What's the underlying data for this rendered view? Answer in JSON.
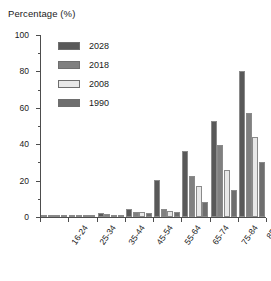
{
  "chart_data": {
    "type": "bar",
    "title": "Percentage (%)",
    "subtitle": "",
    "xlabel": "",
    "ylabel": "Percentage (%)",
    "ylim": [
      0,
      100
    ],
    "yticks": [
      0,
      20,
      40,
      60,
      80,
      100
    ],
    "yticks_minor": [
      10,
      30,
      50,
      70,
      90
    ],
    "grid": false,
    "legend_position": "top-left",
    "categories": [
      "16-24",
      "25-34",
      "35-44",
      "45-54",
      "55-64",
      "65-74",
      "75-84",
      "85+"
    ],
    "series": [
      {
        "name": "2028",
        "color": "#595959",
        "values": [
          0.3,
          0.8,
          2.0,
          4.5,
          20.5,
          36.0,
          53.0,
          80.5
        ]
      },
      {
        "name": "2018",
        "color": "#808080",
        "values": [
          0.2,
          0.6,
          1.5,
          3.0,
          4.5,
          22.5,
          39.5,
          57.0
        ]
      },
      {
        "name": "2008",
        "color": "#e8e8e8",
        "values": [
          0.2,
          0.5,
          1.2,
          2.5,
          3.5,
          17.0,
          26.0,
          44.0
        ]
      },
      {
        "name": "1990",
        "color": "#6e6e6e",
        "values": [
          0.1,
          0.4,
          1.0,
          2.0,
          2.5,
          8.0,
          15.0,
          30.0
        ]
      }
    ]
  },
  "legend": {
    "items": [
      {
        "label": "2028"
      },
      {
        "label": "2018"
      },
      {
        "label": "2008"
      },
      {
        "label": "1990"
      }
    ]
  },
  "colors": {
    "axis": "#4d4d4d",
    "text": "#1a1a1a",
    "bar_edge": "#8a8a8a",
    "background": "#ffffff"
  }
}
